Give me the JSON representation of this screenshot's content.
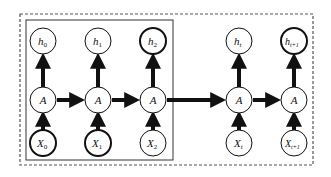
{
  "diagram": {
    "colors": {
      "stroke": "#111111",
      "dashed_border": "#555555",
      "background": "#ffffff"
    },
    "outputs": [
      {
        "id": "h0",
        "base": "h",
        "sub": "0",
        "bold": false
      },
      {
        "id": "h1",
        "base": "h",
        "sub": "1",
        "bold": false
      },
      {
        "id": "h2",
        "base": "h",
        "sub": "2",
        "bold": true
      },
      {
        "id": "ht",
        "base": "h",
        "sub": "t",
        "bold": false
      },
      {
        "id": "ht1",
        "base": "h",
        "sub": "t+1",
        "bold": true
      }
    ],
    "cells": [
      {
        "id": "A0",
        "label": "A"
      },
      {
        "id": "A1",
        "label": "A"
      },
      {
        "id": "A2",
        "label": "A"
      },
      {
        "id": "At",
        "label": "A"
      },
      {
        "id": "At1",
        "label": "A"
      }
    ],
    "inputs": [
      {
        "id": "X0",
        "base": "X",
        "sub": "0",
        "bold": true
      },
      {
        "id": "X1",
        "base": "X",
        "sub": "1",
        "bold": true
      },
      {
        "id": "X2",
        "base": "X",
        "sub": "2",
        "bold": false
      },
      {
        "id": "Xt",
        "base": "X",
        "sub": "t",
        "bold": false
      },
      {
        "id": "Xt1",
        "base": "X",
        "sub": "t+1",
        "bold": false
      }
    ],
    "groups": [
      {
        "id": "window",
        "style": "solid",
        "contains": [
          "h0",
          "h1",
          "h2",
          "A0",
          "A1",
          "A2",
          "X0",
          "X1",
          "X2"
        ]
      },
      {
        "id": "full-sequence",
        "style": "dashed"
      }
    ]
  }
}
